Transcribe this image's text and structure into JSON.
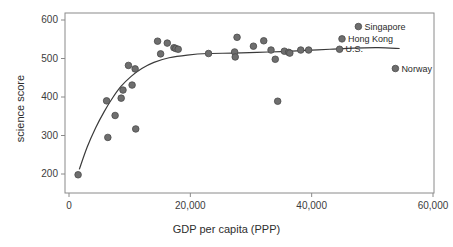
{
  "chart_data": {
    "type": "scatter",
    "title": "",
    "xlabel": "GDP per capita (PPP)",
    "ylabel": "science score",
    "xlim": [
      0,
      60000
    ],
    "ylim": [
      180,
      615
    ],
    "grid": false,
    "legend": "none",
    "xticks": [
      0,
      20000,
      40000,
      60000
    ],
    "xtick_labels": [
      "0",
      "20,000",
      "40,000",
      "60,000"
    ],
    "yticks": [
      200,
      300,
      400,
      500,
      600
    ],
    "ytick_labels": [
      "200",
      "300",
      "400",
      "500",
      "600"
    ],
    "marker_color": "#6e6e6e",
    "marker_edge_color": "#4a4a4a",
    "trend_line_color": "#3a3a3a",
    "axis_color": "#8a8a8a",
    "points": [
      {
        "x": 1500,
        "y": 198,
        "label": ""
      },
      {
        "x": 6200,
        "y": 390,
        "label": ""
      },
      {
        "x": 6400,
        "y": 295,
        "label": ""
      },
      {
        "x": 7600,
        "y": 352,
        "label": ""
      },
      {
        "x": 8600,
        "y": 397,
        "label": ""
      },
      {
        "x": 8900,
        "y": 418,
        "label": ""
      },
      {
        "x": 9800,
        "y": 482,
        "label": ""
      },
      {
        "x": 10400,
        "y": 431,
        "label": ""
      },
      {
        "x": 10900,
        "y": 473,
        "label": ""
      },
      {
        "x": 11000,
        "y": 317,
        "label": ""
      },
      {
        "x": 14600,
        "y": 545,
        "label": ""
      },
      {
        "x": 15100,
        "y": 512,
        "label": ""
      },
      {
        "x": 16200,
        "y": 540,
        "label": ""
      },
      {
        "x": 17300,
        "y": 528,
        "label": ""
      },
      {
        "x": 17600,
        "y": 526,
        "label": ""
      },
      {
        "x": 18000,
        "y": 524,
        "label": ""
      },
      {
        "x": 23000,
        "y": 513,
        "label": ""
      },
      {
        "x": 27300,
        "y": 517,
        "label": ""
      },
      {
        "x": 27400,
        "y": 504,
        "label": ""
      },
      {
        "x": 27700,
        "y": 555,
        "label": ""
      },
      {
        "x": 30400,
        "y": 532,
        "label": ""
      },
      {
        "x": 32100,
        "y": 546,
        "label": ""
      },
      {
        "x": 33300,
        "y": 522,
        "label": ""
      },
      {
        "x": 34000,
        "y": 498,
        "label": ""
      },
      {
        "x": 34400,
        "y": 389,
        "label": ""
      },
      {
        "x": 35500,
        "y": 519,
        "label": ""
      },
      {
        "x": 36200,
        "y": 516,
        "label": ""
      },
      {
        "x": 36400,
        "y": 514,
        "label": ""
      },
      {
        "x": 38200,
        "y": 522,
        "label": ""
      },
      {
        "x": 39500,
        "y": 522,
        "label": ""
      },
      {
        "x": 44600,
        "y": 524,
        "label": "U.S."
      },
      {
        "x": 45000,
        "y": 551,
        "label": "Hong Kong"
      },
      {
        "x": 47700,
        "y": 583,
        "label": "Singapore"
      },
      {
        "x": 53800,
        "y": 474,
        "label": "Norway"
      }
    ],
    "annotations": [
      {
        "text": "Singapore",
        "x": 47700,
        "y": 583
      },
      {
        "text": "Hong Kong",
        "x": 45000,
        "y": 551
      },
      {
        "text": "U.S.",
        "x": 44600,
        "y": 524
      },
      {
        "text": "Norway",
        "x": 53800,
        "y": 474
      }
    ],
    "trend_line": {
      "description": "fitted logarithmic-style curve",
      "points": [
        {
          "x": 1700,
          "y": 212
        },
        {
          "x": 3000,
          "y": 270
        },
        {
          "x": 4400,
          "y": 320
        },
        {
          "x": 5800,
          "y": 362
        },
        {
          "x": 7200,
          "y": 398
        },
        {
          "x": 8600,
          "y": 428
        },
        {
          "x": 10200,
          "y": 453
        },
        {
          "x": 12000,
          "y": 474
        },
        {
          "x": 14000,
          "y": 490
        },
        {
          "x": 16500,
          "y": 502
        },
        {
          "x": 19500,
          "y": 509
        },
        {
          "x": 23000,
          "y": 513
        },
        {
          "x": 27000,
          "y": 514
        },
        {
          "x": 31000,
          "y": 516
        },
        {
          "x": 35000,
          "y": 518
        },
        {
          "x": 39000,
          "y": 521
        },
        {
          "x": 43000,
          "y": 524
        },
        {
          "x": 47000,
          "y": 527
        },
        {
          "x": 51000,
          "y": 528
        },
        {
          "x": 54500,
          "y": 526
        }
      ]
    }
  }
}
